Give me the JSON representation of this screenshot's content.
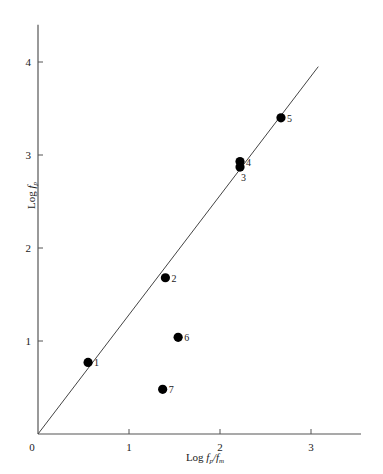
{
  "chart_data": {
    "type": "scatter",
    "title": "",
    "xlabel": "Log fp/fm",
    "ylabel": "Log fp",
    "xlabel_parts": {
      "prefix": "Log ",
      "num_var": "f",
      "num_sub": "p",
      "slash": "/",
      "den_var": "f",
      "den_sub": "m"
    },
    "ylabel_parts": {
      "prefix": "Log ",
      "var": "f",
      "sub": "p"
    },
    "xlim": [
      0,
      3.55
    ],
    "ylim": [
      0,
      4.4
    ],
    "xticks": [
      0,
      1,
      2,
      3
    ],
    "xtick_labels": [
      "0",
      "1",
      "2",
      "3"
    ],
    "yticks": [
      0,
      1,
      2,
      3,
      4
    ],
    "ytick_labels": [
      "0",
      "1",
      "2",
      "3",
      "4"
    ],
    "grid": false,
    "legend": "none",
    "marker_color": "#000000",
    "axis_color": "#555555",
    "line_color": "#444444",
    "reference_line": {
      "name": "one-to-one line",
      "slope": 1.28,
      "intercept": 0,
      "x_start": 0,
      "x_end": 3.08,
      "y_start": 0,
      "y_end": 3.95
    },
    "points": [
      {
        "label": "1",
        "x": 0.55,
        "y": 0.77,
        "label_pos": "right"
      },
      {
        "label": "2",
        "x": 1.4,
        "y": 1.68,
        "label_pos": "right"
      },
      {
        "label": "3",
        "x": 2.22,
        "y": 2.87,
        "label_pos": "below-right"
      },
      {
        "label": "4",
        "x": 2.22,
        "y": 2.93,
        "label_pos": "right"
      },
      {
        "label": "5",
        "x": 2.67,
        "y": 3.4,
        "label_pos": "right"
      },
      {
        "label": "6",
        "x": 1.54,
        "y": 1.04,
        "label_pos": "right"
      },
      {
        "label": "7",
        "x": 1.37,
        "y": 0.48,
        "label_pos": "right"
      }
    ]
  },
  "figure": {
    "background_color": "#ffffff"
  }
}
